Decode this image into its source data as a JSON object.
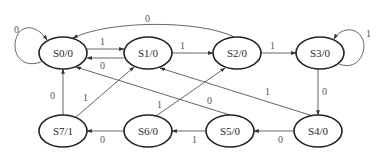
{
  "diagram": {
    "type": "state-machine",
    "colors": {
      "node_stroke": "#222222",
      "edge_stroke": "#555555",
      "text": "#2a2a2a",
      "background": "#ffffff"
    },
    "nodes": [
      {
        "id": "S0",
        "label": "S0/0",
        "cx": 63,
        "cy": 53
      },
      {
        "id": "S1",
        "label": "S1/0",
        "cx": 148,
        "cy": 53
      },
      {
        "id": "S2",
        "label": "S2/0",
        "cx": 237,
        "cy": 53
      },
      {
        "id": "S3",
        "label": "S3/0",
        "cx": 320,
        "cy": 53
      },
      {
        "id": "S4",
        "label": "S4/0",
        "cx": 318,
        "cy": 131
      },
      {
        "id": "S5",
        "label": "S5/0",
        "cx": 230,
        "cy": 131
      },
      {
        "id": "S6",
        "label": "S6/0",
        "cx": 148,
        "cy": 131
      },
      {
        "id": "S7",
        "label": "S7/1",
        "cx": 63,
        "cy": 131
      }
    ],
    "edges": [
      {
        "from": "S0",
        "to": "S0",
        "label": "0"
      },
      {
        "from": "S0",
        "to": "S1",
        "label": "1"
      },
      {
        "from": "S1",
        "to": "S0",
        "label": "0"
      },
      {
        "from": "S1",
        "to": "S2",
        "label": "1"
      },
      {
        "from": "S2",
        "to": "S0",
        "label": "0"
      },
      {
        "from": "S2",
        "to": "S3",
        "label": "1"
      },
      {
        "from": "S3",
        "to": "S3",
        "label": "1"
      },
      {
        "from": "S3",
        "to": "S4",
        "label": "0"
      },
      {
        "from": "S4",
        "to": "S5",
        "label": "0"
      },
      {
        "from": "S4",
        "to": "S1",
        "label": "1"
      },
      {
        "from": "S5",
        "to": "S6",
        "label": "1"
      },
      {
        "from": "S5",
        "to": "S0",
        "label": "0"
      },
      {
        "from": "S6",
        "to": "S7",
        "label": "0"
      },
      {
        "from": "S6",
        "to": "S2",
        "label": "1"
      },
      {
        "from": "S7",
        "to": "S0",
        "label": "0"
      },
      {
        "from": "S7",
        "to": "S1",
        "label": "1"
      }
    ]
  }
}
